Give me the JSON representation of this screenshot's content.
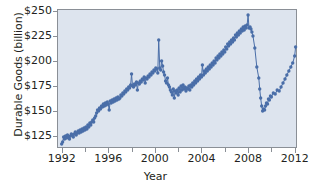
{
  "figure": {
    "title": "",
    "ylabel": "Durable Goods (billion)",
    "xlabel": "Year",
    "plot_bg_color": "#dde4ee",
    "series_color": "#4a6ea8",
    "frame_color": "#8a8f96",
    "text_color": "#231f20"
  },
  "axes": {
    "y_ticks": [
      "$125",
      "$150",
      "$175",
      "$200",
      "$225",
      "$250"
    ],
    "y_tick_values": [
      125,
      150,
      175,
      200,
      225,
      250
    ],
    "x_ticks": [
      "1992",
      "1996",
      "2000",
      "2004",
      "2008",
      "2012"
    ],
    "x_tick_values": [
      1992,
      1996,
      2000,
      2004,
      2008,
      2012
    ],
    "x_minor_ticks": [
      1994,
      1998,
      2002,
      2006,
      2010
    ]
  },
  "chart_data": {
    "type": "line",
    "title": "",
    "xlabel": "Year",
    "ylabel": "Durable Goods (billion)",
    "xlim": [
      1991.6,
      2012.2
    ],
    "ylim": [
      113,
      252
    ],
    "grid": false,
    "legend": "none",
    "marker": "circle",
    "series": [
      {
        "name": "Durable Goods Orders",
        "x": [
          1992.0,
          1992.08,
          1992.17,
          1992.25,
          1992.33,
          1992.42,
          1992.5,
          1992.58,
          1992.67,
          1992.75,
          1992.83,
          1992.92,
          1993.0,
          1993.08,
          1993.17,
          1993.25,
          1993.33,
          1993.42,
          1993.5,
          1993.58,
          1993.67,
          1993.75,
          1993.83,
          1993.92,
          1994.0,
          1994.08,
          1994.17,
          1994.25,
          1994.33,
          1994.42,
          1994.5,
          1994.58,
          1994.67,
          1994.75,
          1994.83,
          1994.92,
          1995.0,
          1995.08,
          1995.17,
          1995.25,
          1995.33,
          1995.42,
          1995.5,
          1995.58,
          1995.67,
          1995.75,
          1995.83,
          1995.92,
          1996.0,
          1996.08,
          1996.17,
          1996.25,
          1996.33,
          1996.42,
          1996.5,
          1996.58,
          1996.67,
          1996.75,
          1996.83,
          1996.92,
          1997.0,
          1997.08,
          1997.17,
          1997.25,
          1997.33,
          1997.42,
          1997.5,
          1997.58,
          1997.67,
          1997.75,
          1997.83,
          1997.92,
          1998.0,
          1998.08,
          1998.17,
          1998.25,
          1998.33,
          1998.42,
          1998.5,
          1998.58,
          1998.67,
          1998.75,
          1998.83,
          1998.92,
          1999.0,
          1999.08,
          1999.17,
          1999.25,
          1999.33,
          1999.42,
          1999.5,
          1999.58,
          1999.67,
          1999.75,
          1999.83,
          1999.92,
          2000.0,
          2000.08,
          2000.17,
          2000.25,
          2000.33,
          2000.42,
          2000.5,
          2000.58,
          2000.67,
          2000.75,
          2000.83,
          2000.92,
          2001.0,
          2001.08,
          2001.17,
          2001.25,
          2001.33,
          2001.42,
          2001.5,
          2001.58,
          2001.67,
          2001.75,
          2001.83,
          2001.92,
          2002.0,
          2002.08,
          2002.17,
          2002.25,
          2002.33,
          2002.42,
          2002.5,
          2002.58,
          2002.67,
          2002.75,
          2002.83,
          2002.92,
          2003.0,
          2003.08,
          2003.17,
          2003.25,
          2003.33,
          2003.42,
          2003.5,
          2003.58,
          2003.67,
          2003.75,
          2003.83,
          2003.92,
          2004.0,
          2004.08,
          2004.17,
          2004.25,
          2004.33,
          2004.42,
          2004.5,
          2004.58,
          2004.67,
          2004.75,
          2004.83,
          2004.92,
          2005.0,
          2005.08,
          2005.17,
          2005.25,
          2005.33,
          2005.42,
          2005.5,
          2005.58,
          2005.67,
          2005.75,
          2005.83,
          2005.92,
          2006.0,
          2006.08,
          2006.17,
          2006.25,
          2006.33,
          2006.42,
          2006.5,
          2006.58,
          2006.67,
          2006.75,
          2006.83,
          2006.92,
          2007.0,
          2007.08,
          2007.17,
          2007.25,
          2007.33,
          2007.42,
          2007.5,
          2007.58,
          2007.67,
          2007.75,
          2007.83,
          2007.92,
          2008.0,
          2008.08,
          2008.17,
          2008.25,
          2008.33,
          2008.42,
          2008.58,
          2008.75,
          2008.92,
          2009.0,
          2009.08,
          2009.17,
          2009.25,
          2009.33,
          2009.42,
          2009.5,
          2009.58,
          2009.67,
          2009.75,
          2009.83,
          2009.92,
          2010.0,
          2010.17,
          2010.33,
          2010.5,
          2010.67,
          2010.83,
          2011.0,
          2011.17,
          2011.33,
          2011.5,
          2011.67,
          2011.83,
          2012.0,
          2012.08
        ],
        "y": [
          117,
          119,
          124,
          122,
          125,
          123,
          126,
          124,
          122,
          125,
          127,
          126,
          124,
          127,
          129,
          126,
          128,
          130,
          128,
          131,
          129,
          132,
          130,
          133,
          131,
          134,
          132,
          136,
          134,
          138,
          136,
          139,
          141,
          139,
          143,
          145,
          148,
          151,
          150,
          153,
          152,
          155,
          154,
          157,
          155,
          158,
          156,
          159,
          157,
          151,
          160,
          158,
          161,
          159,
          162,
          160,
          163,
          161,
          164,
          162,
          163,
          166,
          165,
          168,
          167,
          170,
          169,
          172,
          171,
          174,
          173,
          176,
          187,
          175,
          174,
          177,
          176,
          179,
          171,
          178,
          177,
          180,
          179,
          182,
          181,
          184,
          178,
          183,
          182,
          185,
          184,
          187,
          186,
          189,
          188,
          191,
          190,
          193,
          192,
          188,
          221,
          193,
          191,
          200,
          195,
          189,
          186,
          180,
          178,
          183,
          176,
          174,
          171,
          169,
          166,
          172,
          163,
          170,
          168,
          171,
          166,
          173,
          169,
          175,
          171,
          176,
          172,
          174,
          170,
          173,
          172,
          175,
          171,
          176,
          174,
          178,
          176,
          180,
          178,
          182,
          180,
          184,
          182,
          186,
          184,
          196,
          186,
          190,
          188,
          192,
          190,
          194,
          192,
          196,
          194,
          198,
          196,
          200,
          198,
          203,
          201,
          205,
          203,
          207,
          205,
          209,
          207,
          211,
          209,
          214,
          212,
          217,
          215,
          219,
          217,
          221,
          219,
          223,
          221,
          226,
          224,
          228,
          226,
          230,
          228,
          232,
          230,
          234,
          231,
          235,
          233,
          236,
          246,
          233,
          234,
          232,
          229,
          225,
          213,
          194,
          183,
          172,
          163,
          155,
          150,
          152,
          151,
          155,
          158,
          157,
          162,
          161,
          165,
          164,
          168,
          167,
          171,
          170,
          174,
          178,
          182,
          186,
          190,
          194,
          198,
          205,
          214
        ]
      }
    ]
  }
}
